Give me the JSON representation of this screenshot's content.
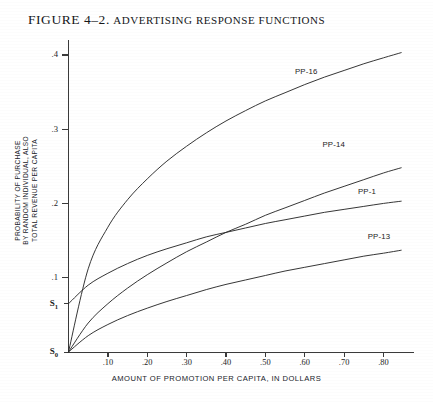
{
  "figure": {
    "title_prefix": "FIGURE 4–2.",
    "title_main": "ADVERTISING RESPONSE FUNCTIONS",
    "title_full": "FIGURE 4–2. ADVERTISING RESPONSE FUNCTIONS"
  },
  "axes": {
    "x_title": "AMOUNT OF PROMOTION PER CAPITA, IN DOLLARS",
    "y_title_line1": "PROBABILITY OF PURCHASE",
    "y_title_line2": "BY RANDOM INDIVIDUAL, ALSO",
    "y_title_line3": "TOTAL REVENUE PER CAPITA"
  },
  "chart_data": {
    "type": "line",
    "title": "FIGURE 4–2. ADVERTISING RESPONSE FUNCTIONS",
    "xlabel": "AMOUNT OF PROMOTION PER CAPITA, IN DOLLARS",
    "ylabel": "PROBABILITY OF PURCHASE BY RANDOM INDIVIDUAL, ALSO TOTAL REVENUE PER CAPITA",
    "xlim": [
      0,
      0.875
    ],
    "ylim": [
      0,
      0.42
    ],
    "grid": false,
    "legend": "inline-curve-labels",
    "x_ticks": [
      0.1,
      0.2,
      0.3,
      0.4,
      0.5,
      0.6,
      0.7,
      0.8
    ],
    "x_tick_labels": [
      ".10",
      ".20",
      ".30",
      ".40",
      ".50",
      ".60",
      ".70",
      ".80"
    ],
    "y_ticks": [
      0.0,
      0.065,
      0.1,
      0.2,
      0.3,
      0.4
    ],
    "y_tick_labels": [
      "S₀",
      "S₁",
      ".1",
      ".2",
      ".3",
      ".4"
    ],
    "special_y_labels": [
      {
        "label": "S0",
        "display": "S",
        "subscript": "0",
        "value": 0.0,
        "meaning": "baseline at origin"
      },
      {
        "label": "S1",
        "display": "S",
        "subscript": "1",
        "value": 0.065,
        "meaning": "nonzero intercept of PP-1"
      }
    ],
    "x": [
      0.0,
      0.05,
      0.1,
      0.15,
      0.2,
      0.25,
      0.3,
      0.35,
      0.4,
      0.45,
      0.5,
      0.55,
      0.6,
      0.65,
      0.7,
      0.75,
      0.8,
      0.845
    ],
    "series": [
      {
        "name": "PP-16",
        "label": "PP-16",
        "intercept": 0.0,
        "label_x": 0.575,
        "label_y": 0.377,
        "values": [
          0.0,
          0.112,
          0.168,
          0.205,
          0.233,
          0.257,
          0.277,
          0.295,
          0.311,
          0.325,
          0.338,
          0.349,
          0.36,
          0.37,
          0.379,
          0.388,
          0.396,
          0.403
        ]
      },
      {
        "name": "PP-14",
        "label": "PP-14",
        "intercept": 0.0,
        "label_x": 0.645,
        "label_y": 0.278,
        "values": [
          0.0,
          0.039,
          0.065,
          0.086,
          0.104,
          0.12,
          0.135,
          0.148,
          0.161,
          0.172,
          0.184,
          0.194,
          0.204,
          0.214,
          0.223,
          0.232,
          0.241,
          0.248
        ]
      },
      {
        "name": "PP-1",
        "label": "PP-1",
        "intercept": 0.065,
        "label_x": 0.735,
        "label_y": 0.215,
        "values": [
          0.065,
          0.09,
          0.106,
          0.119,
          0.13,
          0.139,
          0.147,
          0.155,
          0.161,
          0.167,
          0.173,
          0.178,
          0.183,
          0.188,
          0.192,
          0.196,
          0.2,
          0.203
        ]
      },
      {
        "name": "PP-13",
        "label": "PP-13",
        "intercept": 0.0,
        "label_x": 0.76,
        "label_y": 0.155,
        "values": [
          0.0,
          0.022,
          0.037,
          0.049,
          0.059,
          0.068,
          0.076,
          0.084,
          0.091,
          0.097,
          0.103,
          0.109,
          0.114,
          0.119,
          0.124,
          0.129,
          0.133,
          0.137
        ]
      }
    ]
  },
  "colors": {
    "curve_stroke": "#2b2b2b",
    "axis": "#3a3a3a",
    "text": "#1a1a1a",
    "background": "#ffffff"
  }
}
